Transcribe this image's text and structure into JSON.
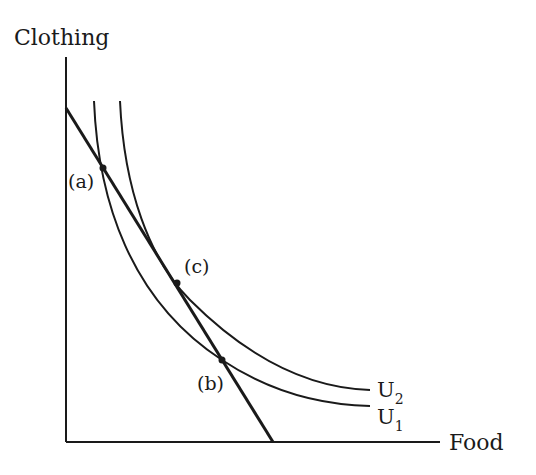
{
  "diagram": {
    "axes": {
      "y_label": "Clothing",
      "x_label": "Food"
    },
    "curves": [
      {
        "id": "U1",
        "label": "U",
        "subscript": "1"
      },
      {
        "id": "U2",
        "label": "U",
        "subscript": "2"
      }
    ],
    "budget_line": {
      "label": ""
    },
    "points": [
      {
        "id": "a",
        "label": "(a)"
      },
      {
        "id": "b",
        "label": "(b)"
      },
      {
        "id": "c",
        "label": "(c)"
      }
    ],
    "colors": {
      "ink": "#1a1a1a",
      "background": "#ffffff"
    }
  }
}
